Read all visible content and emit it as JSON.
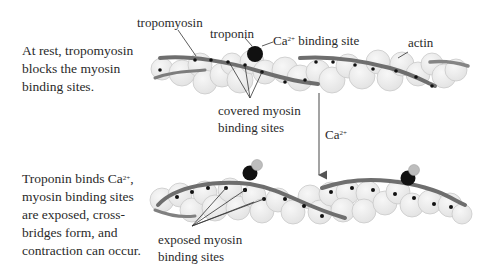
{
  "panels": {
    "rest": {
      "caption_lines": [
        "At rest, tropomyosin",
        "blocks the myosin",
        "binding sites."
      ],
      "labels": {
        "tropomyosin": "tropomyosin",
        "troponin": "troponin",
        "ca_site_prefix": "Ca",
        "ca_site_charge": "2+",
        "ca_site_suffix": " binding site",
        "actin": "actin",
        "covered_line1": "covered myosin",
        "covered_line2": "binding sites"
      }
    },
    "transition": {
      "arrow_label": "Ca",
      "arrow_charge": "2+"
    },
    "active": {
      "caption_line1_prefix": "Troponin binds Ca",
      "caption_line1_charge": "2+",
      "caption_line1_suffix": ",",
      "caption_lines": [
        "myosin binding sites",
        "are exposed, cross-",
        "bridges form, and",
        "contraction can occur."
      ],
      "labels": {
        "exposed_line1": "exposed myosin",
        "exposed_line2": "binding sites",
        "sphere_label": "Ca"
      }
    }
  },
  "colors": {
    "actin_fill": "#ececec",
    "actin_stroke": "#c8c8c8",
    "tropomyosin": "#7a7a7a",
    "troponin": "#111111",
    "calcium_sphere": "#bdbdbd",
    "binding_site": "#111111",
    "text": "#2a2a2a"
  }
}
